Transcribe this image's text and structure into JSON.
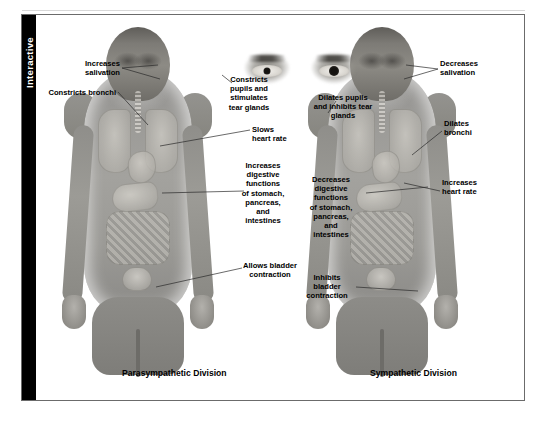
{
  "panel": {
    "tab_label": "Interactive"
  },
  "figures": {
    "left": {
      "title": "Parasympathetic Division"
    },
    "right": {
      "title": "Sympathetic Division"
    }
  },
  "labels": {
    "left_side": [
      {
        "id": "increases-salivation",
        "text": "Increases\nsalivation"
      },
      {
        "id": "constricts-bronchi",
        "text": "Constricts bronchi"
      }
    ],
    "center_left": [
      {
        "id": "constricts-pupils",
        "text": "Constricts\npupils and\nstimulates\ntear glands"
      },
      {
        "id": "slows-heart-rate",
        "text": "Slows\nheart rate"
      },
      {
        "id": "increases-digestive",
        "text": "Increases\ndigestive\nfunctions\nof stomach,\npancreas,\nand\nintestines"
      },
      {
        "id": "allows-bladder",
        "text": "Allows bladder\ncontraction"
      }
    ],
    "center_right": [
      {
        "id": "dilates-pupils",
        "text": "Dilates pupils\nand inhibits tear\nglands"
      },
      {
        "id": "decreases-digestive",
        "text": "Decreases\ndigestive\nfunctions\nof stomach,\npancreas,\nand\nintestines"
      },
      {
        "id": "inhibits-bladder",
        "text": "Inhibits\nbladder\ncontraction"
      }
    ],
    "right_side": [
      {
        "id": "decreases-salivation",
        "text": "Decreases\nsalivation"
      },
      {
        "id": "dilates-bronchi",
        "text": "Dilates\nbronchi"
      },
      {
        "id": "increases-heart-rate",
        "text": "Increases\nheart rate"
      }
    ]
  },
  "caption": {
    "line": "                                                                                          "
  },
  "colors": {
    "tab_background": "#000000",
    "tab_text": "#ffffff",
    "panel_border": "#6b6b6b",
    "label_text": "#000000",
    "leader_line": "#2a2a2a",
    "background": "#ffffff"
  }
}
